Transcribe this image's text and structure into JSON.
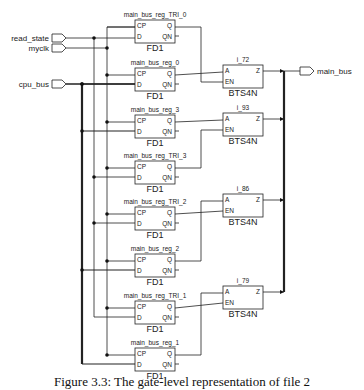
{
  "ports": {
    "inputs": [
      {
        "name": "read_state",
        "y": 38
      },
      {
        "name": "myclk",
        "y": 48
      },
      {
        "name": "cpu_bus",
        "y": 84
      }
    ],
    "outputs": [
      {
        "name": "main_bus",
        "y": 71
      }
    ]
  },
  "flipflops": [
    {
      "name": "main_bus_reg_TRI_0",
      "type": "FD1",
      "top": 20
    },
    {
      "name": "main_bus_reg_0",
      "type": "FD1",
      "top": 68
    },
    {
      "name": "main_bus_reg_3",
      "type": "FD1",
      "top": 115
    },
    {
      "name": "main_bus_reg_TRI_3",
      "type": "FD1",
      "top": 161
    },
    {
      "name": "main_bus_reg_TRI_2",
      "type": "FD1",
      "top": 207
    },
    {
      "name": "main_bus_reg_2",
      "type": "FD1",
      "top": 254
    },
    {
      "name": "main_bus_reg_TRI_1",
      "type": "FD1",
      "top": 301
    },
    {
      "name": "main_bus_reg_1",
      "type": "FD1",
      "top": 348
    }
  ],
  "ff_pins": {
    "cp": "CP",
    "d": "D",
    "q": "Q",
    "qn": "QN"
  },
  "buffers": [
    {
      "name": "i_72",
      "type": "BTS4N",
      "top": 65
    },
    {
      "name": "i_93",
      "type": "BTS4N",
      "top": 113
    },
    {
      "name": "i_86",
      "type": "BTS4N",
      "top": 194
    },
    {
      "name": "i_79",
      "type": "BTS4N",
      "top": 286
    }
  ],
  "buf_pins": {
    "a": "A",
    "en": "EN",
    "z": "Z"
  },
  "caption": "Figure 3.3: The gate-level representation of file 2"
}
